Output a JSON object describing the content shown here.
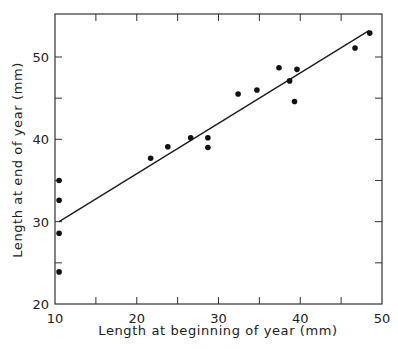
{
  "chart_data": {
    "type": "scatter",
    "title": "",
    "xlabel": "Length at beginning of year (mm)",
    "ylabel": "Length at end of year (mm)",
    "xlim": [
      10,
      50
    ],
    "ylim": [
      20,
      55
    ],
    "x_ticks": [
      10,
      20,
      30,
      40,
      50
    ],
    "y_ticks": [
      20,
      30,
      40,
      50
    ],
    "x_minor_ticks": [
      15,
      25,
      35,
      45
    ],
    "y_minor_ticks": [
      25,
      35,
      45
    ],
    "grid": false,
    "legend": null,
    "series": [
      {
        "name": "observations",
        "type": "scatter",
        "marker": "filled-circle",
        "x": [
          10.5,
          10.5,
          10.5,
          10.5,
          21.7,
          23.8,
          26.6,
          28.7,
          28.7,
          32.4,
          34.7,
          37.4,
          38.7,
          39.6,
          39.3,
          46.7,
          48.5
        ],
        "y": [
          35.0,
          32.6,
          28.6,
          23.9,
          37.7,
          39.1,
          40.2,
          40.2,
          39.0,
          45.5,
          46.0,
          48.7,
          47.1,
          48.5,
          44.6,
          51.1,
          52.9
        ]
      },
      {
        "name": "regression line",
        "type": "line",
        "x": [
          10.5,
          48.4
        ],
        "y": [
          30.0,
          53.2
        ]
      }
    ]
  },
  "colors": {
    "ink": "#1a1a1a",
    "background": "#ffffff"
  }
}
